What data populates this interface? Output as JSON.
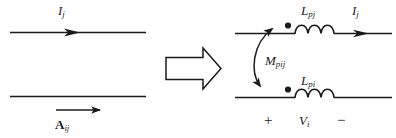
{
  "figure": {
    "stroke_color": "#1a1a1a",
    "background_color": "#ffffff",
    "left_diagram": {
      "name": "two-parallel-conductors",
      "top_conductor_current_label": "I",
      "top_conductor_current_sub": "j",
      "bottom_conductor_vector_label": "A",
      "bottom_conductor_vector_sub": "ij"
    },
    "transform_arrow": {
      "name": "implies-arrow",
      "direction": "right",
      "glyph": "⇒"
    },
    "right_diagram": {
      "name": "coupled-inductor-circuit",
      "upper_inductor_label": "L",
      "upper_inductor_sub": "pj",
      "upper_current_label": "I",
      "upper_current_sub": "j",
      "mutual_label": "M",
      "mutual_sub": "pij",
      "lower_inductor_label": "L",
      "lower_inductor_sub": "pi",
      "voltage_plus": "+",
      "voltage_label": "V",
      "voltage_sub": "i",
      "voltage_minus": "−"
    }
  }
}
